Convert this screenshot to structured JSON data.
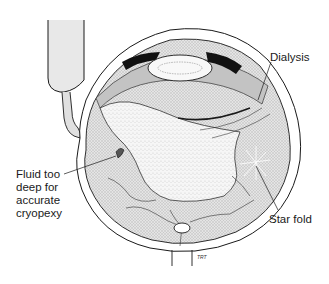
{
  "diagram": {
    "labels": {
      "dialysis": "Dialysis",
      "fluid": [
        "Fluid too",
        "deep for",
        "accurate",
        "cryopexy"
      ],
      "star_fold": "Star fold"
    },
    "signature": "TRT",
    "colors": {
      "line": "#1a1a1a",
      "shading": "#d9d9d9",
      "detached_retina": "#f4f4f4",
      "background": "#ffffff"
    }
  }
}
